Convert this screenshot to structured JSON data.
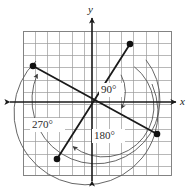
{
  "figure": {
    "name": "coterminal-angles-diagram",
    "axes": {
      "x_label": "x",
      "y_label": "y"
    },
    "grid": {
      "left": 23,
      "top": 31,
      "right": 171,
      "bottom": 175,
      "cell": 12.3,
      "color": "#9a9a9a",
      "border_color": "#808080"
    },
    "origin": {
      "x": 92,
      "y": 102
    },
    "angle_labels": [
      {
        "id": "angle-90",
        "text": "90°",
        "x": 101,
        "y": 84
      },
      {
        "id": "angle-180",
        "text": "180°",
        "x": 94,
        "y": 130
      },
      {
        "id": "angle-270",
        "text": "270°",
        "x": 32,
        "y": 119
      }
    ],
    "terminal_points": [
      {
        "id": "point-90",
        "x": 130,
        "y": 44
      },
      {
        "id": "point-180",
        "x": 157,
        "y": 134
      },
      {
        "id": "point-270",
        "x": 33,
        "y": 66
      },
      {
        "id": "point-initial",
        "x": 57,
        "y": 159
      }
    ],
    "rays": [
      {
        "id": "ray-initial-terminal-90",
        "x1": 57,
        "y1": 159,
        "x2": 130,
        "y2": 44
      },
      {
        "id": "ray-terminal-180-270",
        "x1": 157,
        "y1": 134,
        "x2": 33,
        "y2": 66
      }
    ],
    "arcs": [
      {
        "id": "arc-90",
        "radius": 36
      },
      {
        "id": "arc-180",
        "radius": 50
      },
      {
        "id": "arc-270",
        "radius": 64
      }
    ],
    "colors": {
      "ink": "#1a1a1a",
      "grid": "#9a9a9a",
      "arc": "#555555"
    }
  }
}
